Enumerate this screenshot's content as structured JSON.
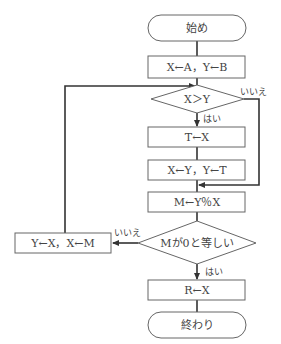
{
  "flowchart": {
    "start": "始め",
    "init": "X←A，Y←B",
    "cond1": "X＞Y",
    "cond1_yes": "はい",
    "cond1_no": "いいえ",
    "step_t": "T←X",
    "step_swap": "X←Y，Y←T",
    "step_mod": "M←Y％X",
    "cond2": "Mが0と等しい",
    "cond2_yes": "はい",
    "cond2_no": "いいえ",
    "step_loop": "Y←X，X←M",
    "step_result": "R←X",
    "end": "終わり"
  }
}
